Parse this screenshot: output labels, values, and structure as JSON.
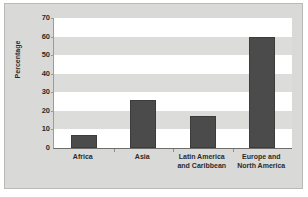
{
  "chart_data": {
    "type": "bar",
    "title": "",
    "xlabel": "",
    "ylabel": "Percentage",
    "categories": [
      "Africa",
      "Asia",
      "Latin America and Caribbean",
      "Europe and North America"
    ],
    "category_lines": [
      [
        "Africa"
      ],
      [
        "Asia"
      ],
      [
        "Latin America",
        "and Caribbean"
      ],
      [
        "Europe and",
        "North America"
      ]
    ],
    "values": [
      7,
      26,
      17,
      60
    ],
    "ylim": [
      0,
      70
    ],
    "yticks": [
      0,
      10,
      20,
      30,
      40,
      50,
      60,
      70
    ],
    "ytick_labels": [
      "0",
      "10",
      "20",
      "30",
      "40",
      "50",
      "60",
      "70"
    ],
    "grid": "alternating-horizontal-bands",
    "legend": null,
    "bar_color": "#4b4b4b",
    "band_color": "#dcdcda",
    "plot_background": "#ffffff",
    "figure_background": "#d9d9d7"
  }
}
